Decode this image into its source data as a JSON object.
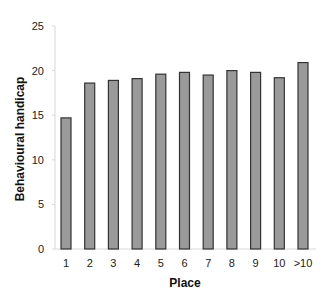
{
  "chart_data": {
    "type": "bar",
    "title": "",
    "xlabel": "Place",
    "ylabel": "Behavioural handicap",
    "categories": [
      "1",
      "2",
      "3",
      "4",
      "5",
      "6",
      "7",
      "8",
      "9",
      "10",
      ">10"
    ],
    "values": [
      14.7,
      18.6,
      18.9,
      19.1,
      19.6,
      19.8,
      19.5,
      20.0,
      19.8,
      19.2,
      20.9
    ],
    "ylim": [
      0,
      25
    ],
    "yticks": [
      0,
      5,
      10,
      15,
      20,
      25
    ],
    "grid": false,
    "legend": null,
    "colors": {
      "bar_fill": "#9a9a9a",
      "bar_stroke": "#333333",
      "axis": "#d8d8d8"
    }
  }
}
